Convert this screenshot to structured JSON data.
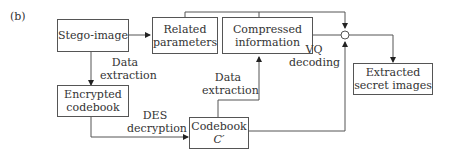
{
  "panel_label": "(b)",
  "nodes": {
    "stego_image": "Stego-image",
    "related_parameters_1": "Related",
    "related_parameters_2": "parameters",
    "compressed_information_1": "Compressed",
    "compressed_information_2": "information",
    "encrypted_codebook_1": "Encrypted",
    "encrypted_codebook_2": "codebook",
    "codebook_1": "Codebook",
    "codebook_2": "C′",
    "extracted_secret_images_1": "Extracted",
    "extracted_secret_images_2": "secret images"
  },
  "edge_labels": {
    "data_extraction_left_1": "Data",
    "data_extraction_left_2": "extraction",
    "data_extraction_mid_1": "Data",
    "data_extraction_mid_2": "extraction",
    "des_decryption_1": "DES",
    "des_decryption_2": "decryption",
    "vq_decoding_1": "VQ",
    "vq_decoding_2": "decoding"
  }
}
